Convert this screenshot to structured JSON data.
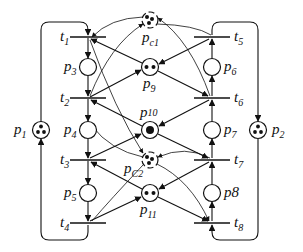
{
  "diagram": {
    "type": "petri-net",
    "places": [
      {
        "id": "p1",
        "label": "p",
        "sub": "1",
        "tokens": 3,
        "x": 41,
        "y": 130
      },
      {
        "id": "p2",
        "label": "p",
        "sub": "2",
        "tokens": 3,
        "x": 258,
        "y": 130
      },
      {
        "id": "p3",
        "label": "p",
        "sub": "3",
        "tokens": 0,
        "x": 88,
        "y": 67
      },
      {
        "id": "p4",
        "label": "p",
        "sub": "4",
        "tokens": 0,
        "x": 88,
        "y": 130
      },
      {
        "id": "p5",
        "label": "p",
        "sub": "5",
        "tokens": 0,
        "x": 88,
        "y": 193
      },
      {
        "id": "p6",
        "label": "p",
        "sub": "6",
        "tokens": 0,
        "x": 212,
        "y": 67
      },
      {
        "id": "p7",
        "label": "p",
        "sub": "7",
        "tokens": 0,
        "x": 212,
        "y": 130
      },
      {
        "id": "p8",
        "label": "p8",
        "sub": "",
        "tokens": 0,
        "x": 212,
        "y": 193
      },
      {
        "id": "p9",
        "label": "p",
        "sub": "9",
        "tokens": 2,
        "x": 150,
        "y": 67
      },
      {
        "id": "p10",
        "label": "p",
        "sub": "10",
        "tokens": 1,
        "x": 150,
        "y": 130
      },
      {
        "id": "p11",
        "label": "p",
        "sub": "11",
        "tokens": 2,
        "x": 150,
        "y": 193
      },
      {
        "id": "pc1",
        "label": "p",
        "sub": "c1",
        "tokens": 3,
        "x": 150,
        "y": 20
      },
      {
        "id": "pc2",
        "label": "p",
        "sub": "C2",
        "tokens": 3,
        "x": 150,
        "y": 160
      }
    ],
    "transitions": [
      {
        "id": "t1",
        "label": "t",
        "sub": "1",
        "x": 88,
        "y": 37
      },
      {
        "id": "t2",
        "label": "t",
        "sub": "2",
        "x": 88,
        "y": 98
      },
      {
        "id": "t3",
        "label": "t",
        "sub": "3",
        "x": 88,
        "y": 160
      },
      {
        "id": "t4",
        "label": "t",
        "sub": "4",
        "x": 88,
        "y": 223
      },
      {
        "id": "t5",
        "label": "t",
        "sub": "5",
        "x": 212,
        "y": 37
      },
      {
        "id": "t6",
        "label": "t",
        "sub": "6",
        "x": 212,
        "y": 98
      },
      {
        "id": "t7",
        "label": "t",
        "sub": "7",
        "x": 212,
        "y": 160
      },
      {
        "id": "t8",
        "label": "t",
        "sub": "8",
        "x": 212,
        "y": 223
      }
    ],
    "colors": {
      "stroke": "#111111",
      "background": "#ffffff"
    }
  }
}
